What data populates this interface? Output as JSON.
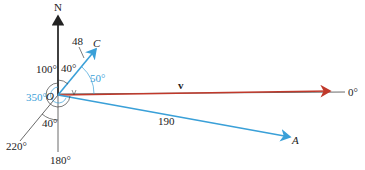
{
  "diagram": {
    "labels": {
      "north": "N",
      "origin": "O",
      "point_c": "C",
      "point_a": "A",
      "vector_v": "v",
      "mag_c": "48",
      "mag_a": "190",
      "angle_0": "0°",
      "angle_180": "180°",
      "angle_220": "220°",
      "angle_100": "100°",
      "angle_40_top": "40°",
      "angle_40_bottom": "40°",
      "angle_50": "50°",
      "angle_350": "350°"
    },
    "colors": {
      "axis": "#222222",
      "vector_blue": "#3aa0d8",
      "vector_red": "#c0392b"
    }
  }
}
